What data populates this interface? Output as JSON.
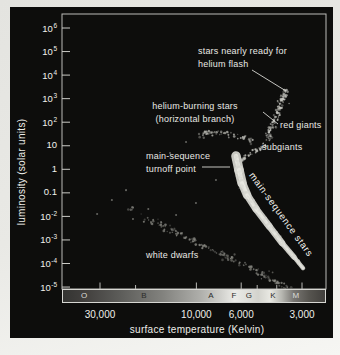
{
  "chart_data": {
    "type": "scatter",
    "xlabel": "surface temperature (Kelvin)",
    "ylabel": "luminosity (solar units)",
    "xlim": [
      46000,
      2300
    ],
    "ylim": [
      1e-05,
      1000000
    ],
    "x_axis": {
      "scale": "log",
      "reversed": true,
      "ticks": [
        {
          "value": 30000,
          "label": "30,000"
        },
        {
          "value": 10000,
          "label": "10,000"
        },
        {
          "value": 6000,
          "label": "6,000"
        },
        {
          "value": 3000,
          "label": "3,000"
        }
      ],
      "minor_ticks": [
        20000,
        5000,
        4000
      ],
      "spectral_classes": [
        {
          "label": "O",
          "t": 36400,
          "shade": "light"
        },
        {
          "label": "B",
          "t": 18380,
          "shade": "dark"
        },
        {
          "label": "A",
          "t": 8560,
          "shade": "dark"
        },
        {
          "label": "F",
          "t": 6590,
          "shade": "dark"
        },
        {
          "label": "G",
          "t": 5559,
          "shade": "dark"
        },
        {
          "label": "K",
          "t": 4227,
          "shade": "dark"
        },
        {
          "label": "M",
          "t": 3251,
          "shade": "light"
        }
      ]
    },
    "y_axis": {
      "scale": "log",
      "ticks": [
        {
          "value": 1000000,
          "mant": "10",
          "exp": "6"
        },
        {
          "value": 100000,
          "mant": "10",
          "exp": "5"
        },
        {
          "value": 10000,
          "mant": "10",
          "exp": "4"
        },
        {
          "value": 1000,
          "mant": "10",
          "exp": "3"
        },
        {
          "value": 100,
          "mant": "10",
          "exp": "2"
        },
        {
          "value": 10,
          "mant": "10",
          "exp": ""
        },
        {
          "value": 1,
          "mant": "1",
          "exp": ""
        },
        {
          "value": 0.1,
          "mant": "0.1",
          "exp": ""
        },
        {
          "value": 0.01,
          "mant": "10",
          "exp": "-2"
        },
        {
          "value": 0.001,
          "mant": "10",
          "exp": "-3"
        },
        {
          "value": 0.0001,
          "mant": "10",
          "exp": "-4"
        },
        {
          "value": 1e-05,
          "mant": "10",
          "exp": "-5"
        }
      ]
    },
    "series": [
      {
        "name": "main-sequence stars",
        "type": "band",
        "color": "#d8d8d2",
        "core_color": "#eaeae4",
        "anchors": [
          [
            6368,
            3.67
          ],
          [
            6153,
            0.93
          ],
          [
            5940,
            0.26
          ],
          [
            5610,
            0.081
          ],
          [
            5070,
            0.021
          ],
          [
            4366,
            0.0039
          ],
          [
            3767,
            0.00074
          ],
          [
            3288,
            0.000189
          ],
          [
            2965,
            6.4e-05
          ]
        ],
        "widths": [
          9,
          10,
          9,
          8,
          7,
          7,
          6,
          5,
          3.5
        ],
        "speckles": 170
      },
      {
        "name": "subgiants",
        "type": "scatter",
        "color": "#c2c2bc",
        "count": 42,
        "spread": 3.2,
        "anchors": [
          [
            6085,
            2.25
          ],
          [
            5423,
            4.5
          ],
          [
            4898,
            7.3
          ],
          [
            4519,
            11.9
          ]
        ]
      },
      {
        "name": "red giants",
        "type": "scatter",
        "color": "#c6c6c0",
        "count": 85,
        "spread": 3.8,
        "outliers": 24,
        "anchors": [
          [
            4467,
            15.9
          ],
          [
            4275,
            46.5
          ],
          [
            4083,
            123
          ],
          [
            3899,
            363
          ],
          [
            3724,
            1066
          ],
          [
            3556,
            2563
          ]
        ]
      },
      {
        "name": "horizontal branch",
        "type": "scatter",
        "color": "#b4b4ae",
        "count": 50,
        "spread": 3.6,
        "outliers": 10,
        "anchors": [
          [
            9817,
            28.6
          ],
          [
            8366,
            38.2
          ],
          [
            7129,
            31.5
          ],
          [
            6085,
            23.5
          ],
          [
            5188,
            19.2
          ]
        ]
      },
      {
        "name": "white dwarfs",
        "type": "scatter",
        "color": "#8e8e88",
        "count": 150,
        "spread": 4.6,
        "bias": 0.72,
        "outliers": 20,
        "anchors": [
          [
            22544,
            0.028
          ],
          [
            16962,
            0.0071
          ],
          [
            12748,
            0.0022
          ],
          [
            9594,
            0.00068
          ],
          [
            7212,
            0.00021
          ],
          [
            5423,
            6.5e-05
          ],
          [
            4083,
            1.82e-05
          ],
          [
            3444,
            8.3e-06
          ]
        ]
      },
      {
        "name": "field stars",
        "type": "points",
        "color": "#82827c",
        "points": [
          [
            31000,
            0.0126
          ],
          [
            26200,
            0.05
          ],
          [
            22300,
            0.13
          ],
          [
            20600,
            0.0078
          ],
          [
            17300,
            0.0205
          ],
          [
            14960,
            0.00575
          ],
          [
            12600,
            0.0115
          ],
          [
            11250,
            14.5
          ],
          [
            13500,
            4.9
          ],
          [
            8000,
            0.35
          ],
          [
            10050,
            0.037
          ],
          [
            6823,
            138
          ]
        ]
      }
    ],
    "annotations": [
      {
        "id": "helium-flash",
        "lines": [
          "stars nearly ready for",
          "helium flash"
        ]
      },
      {
        "id": "horizontal-branch",
        "lines": [
          "helium-burning stars",
          "(horizontal branch)"
        ]
      },
      {
        "id": "red-giants",
        "text": "red giants"
      },
      {
        "id": "subgiants",
        "text": "subgiants"
      },
      {
        "id": "turnoff",
        "lines": [
          "main-sequence",
          "turnoff point"
        ]
      },
      {
        "id": "main-sequence",
        "text": "main-sequence stars"
      },
      {
        "id": "white-dwarfs",
        "text": "white dwarfs"
      }
    ]
  }
}
